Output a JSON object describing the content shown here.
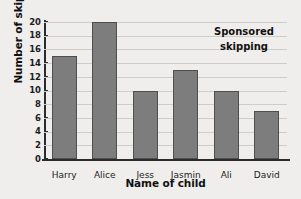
{
  "chart_data": {
    "type": "bar",
    "title_lines": [
      "Sponsored",
      "skipping"
    ],
    "xlabel": "Name of child",
    "ylabel": "Number of skips",
    "categories": [
      "Harry",
      "Alice",
      "Jess",
      "Jasmin",
      "Ali",
      "David"
    ],
    "values": [
      15,
      20,
      10,
      13,
      10,
      7
    ],
    "ylim": [
      0,
      20
    ],
    "ytick_step": 2,
    "yticks": [
      0,
      2,
      4,
      6,
      8,
      10,
      12,
      14,
      16,
      18,
      20
    ],
    "grid": true,
    "grid_axis": "y",
    "legend": "none",
    "bar_color": "#7d7d7d",
    "bar_edge_color": "#4f4f4f",
    "background_color": "#efeeec",
    "grid_color": "#cfcdc9",
    "axis_color": "#2b2b2b",
    "text_color": "#1c1c1c"
  }
}
